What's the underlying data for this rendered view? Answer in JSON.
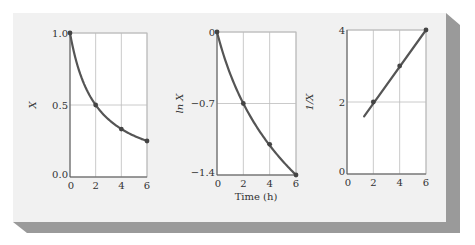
{
  "colors": {
    "card_bg": "#f1f1f1",
    "shadow": "#9a9a9a",
    "plot_bg": "#ffffff",
    "grid": "#bdbdbd",
    "axis": "#555555",
    "curve": "#555555",
    "marker": "#444444"
  },
  "shared_xlabel": "Time (h)",
  "chart_data": [
    {
      "type": "line",
      "title": "",
      "xlabel": "",
      "ylabel": "X",
      "xlim": [
        0,
        6
      ],
      "ylim": [
        0.0,
        1.0
      ],
      "x_ticks": [
        "0",
        "2",
        "4",
        "6"
      ],
      "y_ticks": [
        "0.0",
        "0.5",
        "1.0"
      ],
      "y_tick_values": [
        0.0,
        0.5,
        1.0
      ],
      "grid": true,
      "series": [
        {
          "name": "X",
          "x": [
            0,
            2,
            4,
            6
          ],
          "y": [
            1.0,
            0.5,
            0.333,
            0.25
          ],
          "curve": "1/(1+0.5t)"
        }
      ]
    },
    {
      "type": "line",
      "title": "",
      "xlabel": "Time (h)",
      "ylabel": "ln X",
      "xlim": [
        0,
        6
      ],
      "ylim": [
        -1.4,
        0
      ],
      "x_ticks": [
        "0",
        "2",
        "4",
        "6"
      ],
      "y_ticks": [
        "−1.4",
        "−0.7",
        "0"
      ],
      "y_tick_values": [
        -1.4,
        -0.7,
        0
      ],
      "grid": true,
      "series": [
        {
          "name": "ln X",
          "x": [
            0,
            2,
            4,
            6
          ],
          "y": [
            0,
            -0.7,
            -1.1,
            -1.4
          ],
          "curve": "ln(1/(1+0.5t))"
        }
      ]
    },
    {
      "type": "line",
      "title": "",
      "xlabel": "",
      "ylabel": "1/X",
      "xlim": [
        0,
        6
      ],
      "ylim": [
        0,
        4
      ],
      "x_ticks": [
        "0",
        "2",
        "4",
        "6"
      ],
      "y_ticks": [
        "0",
        "2",
        "4"
      ],
      "y_tick_values": [
        0,
        2,
        4
      ],
      "grid": true,
      "series": [
        {
          "name": "1/X",
          "x": [
            2,
            4,
            6
          ],
          "y": [
            2,
            3,
            4
          ],
          "line_start": [
            1.3,
            1.6
          ],
          "curve": "1+0.5t"
        }
      ]
    }
  ]
}
